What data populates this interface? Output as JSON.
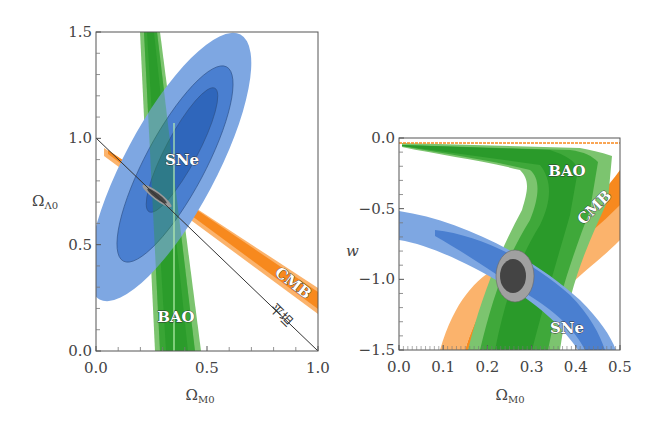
{
  "chart_data": [
    {
      "type": "contour",
      "panel": "left",
      "xlabel": "Ω_M0",
      "xlabel_main": "Ω",
      "xlabel_sub": "M0",
      "ylabel": "Ω_Λ0",
      "ylabel_main": "Ω",
      "ylabel_sub": "Λ0",
      "xlim": [
        0.0,
        1.0
      ],
      "ylim": [
        0.0,
        1.5
      ],
      "xticks": [
        "0.0",
        "0.5",
        "1.0"
      ],
      "xtick_values": [
        0.0,
        0.5,
        1.0
      ],
      "yticks": [
        "0.0",
        "0.5",
        "1.0",
        "1.5"
      ],
      "ytick_values": [
        0.0,
        0.5,
        1.0,
        1.5
      ],
      "minor_xticks": [
        0.1,
        0.2,
        0.3,
        0.4,
        0.6,
        0.7,
        0.8,
        0.9
      ],
      "minor_yticks": [
        0.1,
        0.2,
        0.3,
        0.4,
        0.6,
        0.7,
        0.8,
        0.9,
        1.1,
        1.2,
        1.3,
        1.4
      ],
      "series": [
        {
          "name": "SNe",
          "color": "#4a7fd0",
          "kind": "ellipse",
          "center": [
            0.35,
            0.85
          ],
          "levels": 3
        },
        {
          "name": "BAO",
          "color": "#2ea02e",
          "kind": "band",
          "top_x": [
            0.13,
            0.23
          ],
          "bottom_x": [
            0.27,
            0.46
          ],
          "levels": 3
        },
        {
          "name": "CMB",
          "color": "#f7891e",
          "kind": "band",
          "from": [
            0.04,
            0.93
          ],
          "to": [
            1.0,
            0.18
          ],
          "levels": 2
        },
        {
          "name": "combined",
          "color": "#555555",
          "kind": "ellipse",
          "center": [
            0.28,
            0.72
          ],
          "levels": 2
        }
      ],
      "lines": [
        {
          "name": "flat",
          "label": "平坦",
          "points": [
            [
              0.0,
              1.0
            ],
            [
              1.0,
              0.0
            ]
          ],
          "color": "#333333"
        },
        {
          "name": "vertical-marker",
          "points": [
            [
              0.35,
              0.0
            ],
            [
              0.35,
              1.07
            ]
          ],
          "color": "#a6e3a6"
        }
      ],
      "annotations": [
        {
          "text": "SNe",
          "at": [
            0.37,
            0.89
          ]
        },
        {
          "text": "BAO",
          "at": [
            0.3,
            0.19
          ]
        },
        {
          "text": "CMB",
          "at": [
            0.86,
            0.29
          ],
          "rotation": -38
        },
        {
          "text": "平坦",
          "at": [
            0.82,
            0.14
          ],
          "rotation": 45
        }
      ]
    },
    {
      "type": "contour",
      "panel": "right",
      "xlabel": "Ω_M0",
      "xlabel_main": "Ω",
      "xlabel_sub": "M0",
      "ylabel": "w",
      "xlim": [
        0.0,
        0.5
      ],
      "ylim": [
        -1.5,
        0.0
      ],
      "xticks": [
        "0.0",
        "0.1",
        "0.2",
        "0.3",
        "0.4",
        "0.5"
      ],
      "xtick_values": [
        0.0,
        0.1,
        0.2,
        0.3,
        0.4,
        0.5
      ],
      "yticks": [
        "0.0",
        "−0.5",
        "−1.0",
        "−1.5"
      ],
      "ytick_values": [
        0.0,
        -0.5,
        -1.0,
        -1.5
      ],
      "minor_yticks": [
        -0.1,
        -0.2,
        -0.3,
        -0.4,
        -0.6,
        -0.7,
        -0.8,
        -0.9,
        -1.1,
        -1.2,
        -1.3,
        -1.4
      ],
      "series": [
        {
          "name": "BAO",
          "color": "#2ea02e",
          "kind": "band",
          "levels": 3
        },
        {
          "name": "CMB",
          "color": "#f7891e",
          "kind": "band",
          "levels": 2
        },
        {
          "name": "SNe",
          "color": "#4a7fd0",
          "kind": "band",
          "levels": 3
        },
        {
          "name": "combined",
          "color": "#555555",
          "kind": "ellipse",
          "center": [
            0.27,
            -0.98
          ],
          "levels": 2
        }
      ],
      "annotations": [
        {
          "text": "BAO",
          "at": [
            0.4,
            -0.21
          ]
        },
        {
          "text": "CMB",
          "at": [
            0.44,
            -0.52
          ],
          "rotation": -45
        },
        {
          "text": "SNe",
          "at": [
            0.37,
            -1.34
          ]
        }
      ]
    }
  ]
}
